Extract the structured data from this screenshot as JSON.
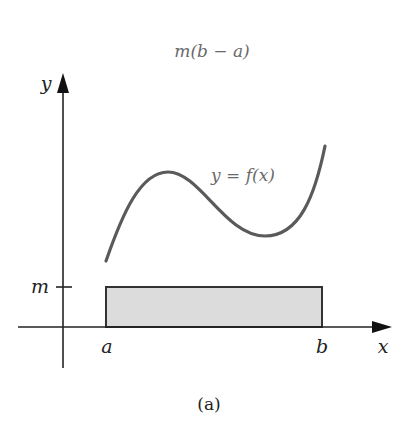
{
  "figure": {
    "top_label": "m(b − a)",
    "curve_label": "y = f(x)",
    "caption": "(a)",
    "axes": {
      "x_label": "x",
      "y_label": "y",
      "x_ticks": [
        "a",
        "b"
      ],
      "y_ticks": [
        "m"
      ]
    },
    "colors": {
      "axis": "#222222",
      "curve": "#5a5a5a",
      "rect_fill": "#dcdcdc",
      "rect_stroke": "#333333",
      "text_gray": "#6a6a6a"
    }
  }
}
